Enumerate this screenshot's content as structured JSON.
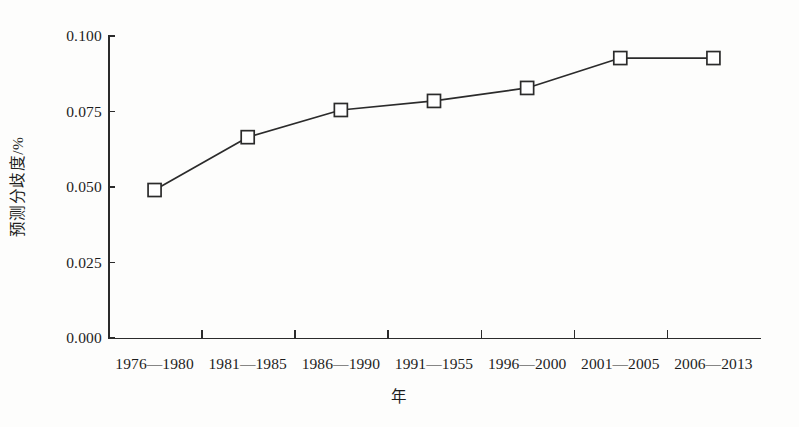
{
  "chart_data": {
    "type": "line",
    "title": "",
    "xlabel": "年",
    "ylabel": "预测分歧度/%",
    "categories": [
      "1976—1980",
      "1981—1985",
      "1986—1990",
      "1991—1955",
      "1996—2000",
      "2001—2005",
      "2006—2013"
    ],
    "values": [
      0.049,
      0.0665,
      0.0755,
      0.0785,
      0.0828,
      0.0927,
      0.0927
    ],
    "series": [
      {
        "name": "预测分歧度",
        "values": [
          0.049,
          0.0665,
          0.0755,
          0.0785,
          0.0828,
          0.0927,
          0.0927
        ]
      }
    ],
    "ylim": [
      0.0,
      0.1
    ],
    "ytick_labels": [
      "0.000",
      "0.025",
      "0.050",
      "0.075",
      "0.100"
    ],
    "ytick_values": [
      0.0,
      0.025,
      0.05,
      0.075,
      0.1
    ],
    "grid": false,
    "legend": "none",
    "marker": "open-square",
    "line_color": "#2b2b2b",
    "marker_fill": "#ffffff",
    "background": "#fdfdfc"
  }
}
